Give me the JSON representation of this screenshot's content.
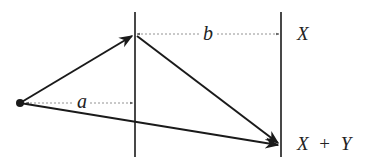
{
  "diagram": {
    "labels": {
      "a": "a",
      "b": "b",
      "x": "X",
      "x_plus_y_x": "X",
      "x_plus_y_op": "+",
      "x_plus_y_y": "Y"
    },
    "colors": {
      "stroke": "#1a1a1a",
      "dashed": "#777777",
      "text": "#222222"
    }
  }
}
